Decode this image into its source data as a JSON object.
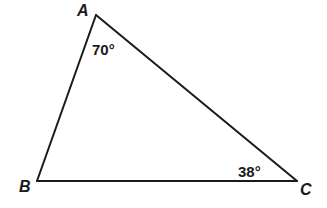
{
  "diagram": {
    "type": "triangle",
    "stroke_color": "#1a1a1a",
    "background": "#ffffff",
    "vertices": {
      "A": {
        "label": "A",
        "x": 96,
        "y": 15
      },
      "B": {
        "label": "B",
        "x": 37,
        "y": 181
      },
      "C": {
        "label": "C",
        "x": 297,
        "y": 181
      }
    },
    "edges": [
      {
        "from": "A",
        "to": "B"
      },
      {
        "from": "B",
        "to": "C"
      },
      {
        "from": "C",
        "to": "A"
      }
    ],
    "angles": {
      "A": {
        "vertex": "A",
        "value": "70°"
      },
      "C": {
        "vertex": "C",
        "value": "38°"
      }
    }
  }
}
